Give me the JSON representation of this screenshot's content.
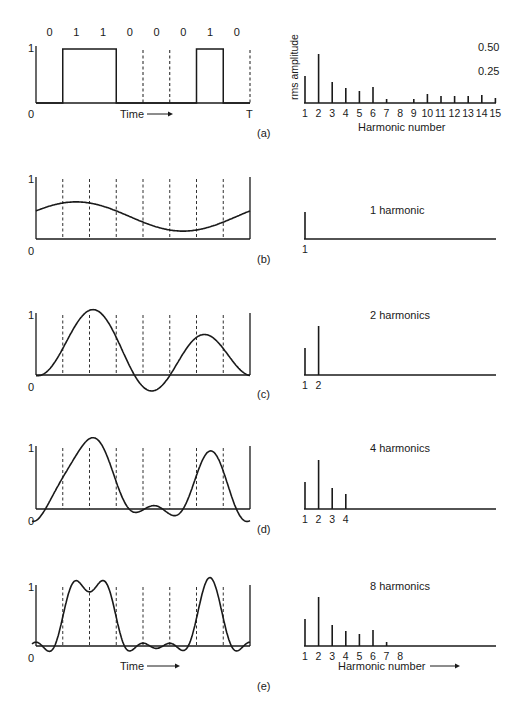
{
  "figure": {
    "signal_bits": [
      "0",
      "1",
      "1",
      "0",
      "0",
      "0",
      "1",
      "0"
    ],
    "time_label": "Time",
    "end_label": "T",
    "y_top_label": "1",
    "y_zero_label": "0",
    "panel_labels": [
      "(a)",
      "(b)",
      "(c)",
      "(d)",
      "(e)"
    ],
    "spectrum": {
      "ylabel": "rms amplitude",
      "xlabel": "Harmonic number",
      "tick_050": "0.50",
      "tick_025": "0.25"
    },
    "harmonic_titles": [
      "1 harmonic",
      "2 harmonics",
      "4 harmonics",
      "8 harmonics"
    ],
    "harmonic_counts": [
      1,
      2,
      4,
      8
    ]
  },
  "colors": {
    "ink": "#1a1a1a",
    "background": "#ffffff"
  },
  "chart_data": [
    {
      "type": "line",
      "title": "(a) Binary signal 01100010",
      "xlabel": "Time",
      "ylabel": "",
      "bits": [
        0,
        1,
        1,
        0,
        0,
        0,
        1,
        0
      ],
      "x_range": [
        "0",
        "T"
      ],
      "ylim": [
        0,
        1
      ]
    },
    {
      "type": "bar",
      "title": "(a) Root-mean-square Fourier amplitudes",
      "xlabel": "Harmonic number",
      "ylabel": "rms amplitude",
      "categories": [
        "1",
        "2",
        "3",
        "4",
        "5",
        "6",
        "7",
        "8",
        "9",
        "10",
        "11",
        "12",
        "13",
        "14",
        "15"
      ],
      "values": [
        0.27,
        0.49,
        0.21,
        0.15,
        0.12,
        0.16,
        0.04,
        0.0,
        0.04,
        0.09,
        0.07,
        0.07,
        0.07,
        0.08,
        0.05
      ],
      "yticks": [
        0.25,
        0.5
      ]
    },
    {
      "type": "line",
      "title": "(b) 1 harmonic",
      "harmonics": 1,
      "xlabel": "",
      "ylim": [
        0,
        1
      ]
    },
    {
      "type": "bar",
      "title": "1 harmonic",
      "categories": [
        "1"
      ],
      "values": [
        0.27
      ]
    },
    {
      "type": "line",
      "title": "(c) 2 harmonics",
      "harmonics": 2,
      "ylim": [
        0,
        1
      ]
    },
    {
      "type": "bar",
      "title": "2 harmonics",
      "categories": [
        "1",
        "2"
      ],
      "values": [
        0.27,
        0.49
      ]
    },
    {
      "type": "line",
      "title": "(d) 4 harmonics",
      "harmonics": 4,
      "ylim": [
        0,
        1
      ]
    },
    {
      "type": "bar",
      "title": "4 harmonics",
      "categories": [
        "1",
        "2",
        "3",
        "4"
      ],
      "values": [
        0.27,
        0.49,
        0.21,
        0.15
      ]
    },
    {
      "type": "line",
      "title": "(e) 8 harmonics",
      "harmonics": 8,
      "xlabel": "Time",
      "ylim": [
        0,
        1
      ]
    },
    {
      "type": "bar",
      "title": "8 harmonics",
      "xlabel": "Harmonic number",
      "categories": [
        "1",
        "2",
        "3",
        "4",
        "5",
        "6",
        "7",
        "8"
      ],
      "values": [
        0.27,
        0.49,
        0.21,
        0.15,
        0.12,
        0.16,
        0.04,
        0.0
      ]
    }
  ]
}
